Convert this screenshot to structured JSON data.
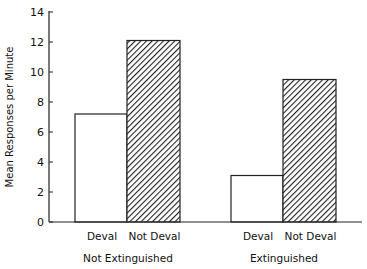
{
  "chart_data": {
    "type": "bar",
    "title": "",
    "xlabel": "",
    "ylabel": "Mean Responses per Minute",
    "ylim": [
      0,
      14
    ],
    "yticks": [
      0,
      2,
      4,
      6,
      8,
      10,
      12,
      14
    ],
    "grid": false,
    "legend": null,
    "groups": [
      "Not Extinguished",
      "Extinguished"
    ],
    "categories": [
      "Deval",
      "Not Deval"
    ],
    "series": [
      {
        "name": "Deval",
        "fill": "white",
        "values": [
          7.2,
          3.1
        ]
      },
      {
        "name": "Not Deval",
        "fill": "diagonal-hatch",
        "values": [
          12.1,
          9.5
        ]
      }
    ],
    "bars": [
      {
        "group": "Not Extinguished",
        "label": "Deval",
        "value": 7.2,
        "fill": "white"
      },
      {
        "group": "Not Extinguished",
        "label": "Not Deval",
        "value": 12.1,
        "fill": "hatch"
      },
      {
        "group": "Extinguished",
        "label": "Deval",
        "value": 3.1,
        "fill": "white"
      },
      {
        "group": "Extinguished",
        "label": "Not Deval",
        "value": 9.5,
        "fill": "hatch"
      }
    ]
  },
  "colors": {
    "line": "#222222",
    "background": "#ffffff"
  }
}
